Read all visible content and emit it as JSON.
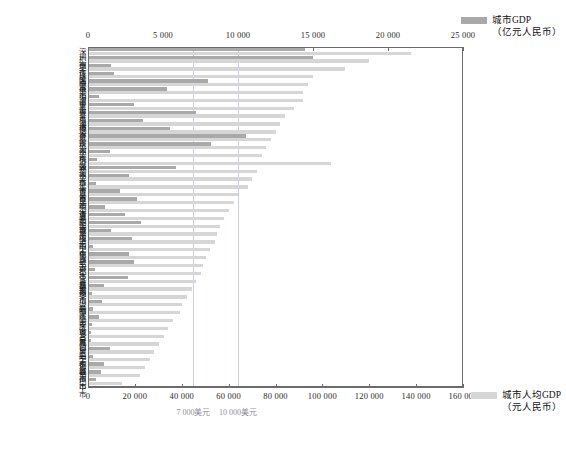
{
  "chart_data": {
    "type": "bar",
    "orientation": "horizontal",
    "title": "",
    "grid": false,
    "legend_position": "right",
    "top_axis": {
      "label": "城市GDP（亿元人民币）",
      "ticks": [
        "0",
        "5 000",
        "10 000",
        "15 000",
        "20 000",
        "25 000"
      ],
      "values": [
        0,
        5000,
        10000,
        15000,
        20000,
        25000
      ],
      "range": [
        0,
        25000
      ]
    },
    "bottom_axis": {
      "label": "城市人均GDP（元人民币）",
      "ticks": [
        "0",
        "20 000",
        "40 000",
        "60 000",
        "80 000",
        "100 000",
        "120 000",
        "140 000",
        "160 000"
      ],
      "values": [
        0,
        20000,
        40000,
        60000,
        80000,
        100000,
        120000,
        140000,
        160000
      ],
      "range": [
        0,
        160000
      ]
    },
    "reference_lines": [
      {
        "label": "7 000美元",
        "value": 45000
      },
      {
        "label": "10 000美元",
        "value": 64000
      }
    ],
    "series": [
      {
        "name": "城市GDP",
        "unit": "亿元人民币",
        "color": "#a9a9a9",
        "axis": "top"
      },
      {
        "name": "城市人均GDP",
        "unit": "元人民币",
        "color": "#d6d6d6",
        "axis": "bottom"
      }
    ],
    "categories": [
      "深圳市",
      "广州市",
      "吴江区",
      "珠海市",
      "南京市",
      "佛山市",
      "海宁市",
      "嘉兴市",
      "青岛市",
      "淄博市",
      "烟台市",
      "武汉市",
      "杭州市",
      "余杭区",
      "济源市",
      "郑州市",
      "金华市",
      "延吉市",
      "吉首市",
      "昆明市",
      "乐清市",
      "襄阳市",
      "盐城市",
      "莆田市",
      "洛阳市",
      "宁化县",
      "南宁市",
      "绍兴市",
      "都江堰市",
      "宜昌市",
      "彭州市",
      "黎川县",
      "汾阳市",
      "临江市",
      "临安市",
      "庆城县",
      "多宝镇",
      "城口县",
      "阜阳市",
      "宁都县",
      "运城市",
      "宿州市",
      "巴中市"
    ],
    "gdp_values": [
      14500,
      15000,
      1500,
      1700,
      8000,
      5200,
      700,
      3000,
      7200,
      3600,
      5400,
      10500,
      8200,
      1400,
      550,
      5800,
      2700,
      500,
      2100,
      3200,
      1100,
      2400,
      3500,
      1500,
      2900,
      300,
      2650,
      3000,
      400,
      2600,
      1000,
      200,
      900,
      250,
      700,
      180,
      120,
      160,
      1400,
      260,
      1000,
      800,
      450
    ],
    "percapita_values": [
      138000,
      120000,
      110000,
      96000,
      94000,
      92000,
      92000,
      88000,
      84000,
      82000,
      80000,
      78000,
      76000,
      74000,
      104000,
      72000,
      70000,
      68000,
      64000,
      62000,
      60000,
      58000,
      56000,
      55000,
      54000,
      52000,
      50000,
      49000,
      48000,
      46000,
      44000,
      42000,
      40000,
      39000,
      36000,
      34000,
      32000,
      30000,
      28000,
      26000,
      24000,
      22000,
      14000
    ]
  },
  "legend": {
    "top": {
      "name": "城市GDP",
      "unit": "（亿元人民币）",
      "color": "#a9a9a9"
    },
    "bottom": {
      "name": "城市人均GDP",
      "unit": "（元人民币）",
      "color": "#d6d6d6"
    }
  }
}
